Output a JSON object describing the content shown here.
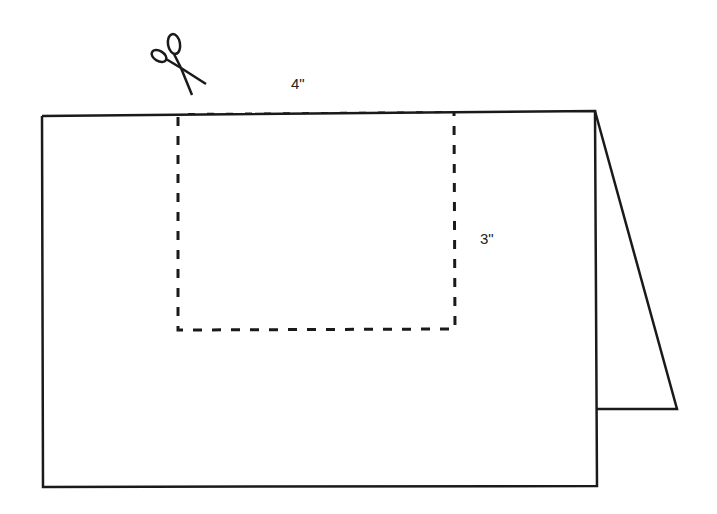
{
  "diagram": {
    "type": "folded-card-cutout",
    "labels": {
      "width": "4\"",
      "height": "3\""
    },
    "icons": [
      "scissors-icon"
    ],
    "colors": {
      "line": "#1a1a1a",
      "background": "#ffffff"
    }
  }
}
